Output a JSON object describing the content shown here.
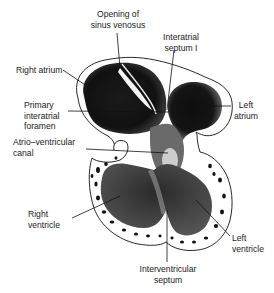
{
  "figure": {
    "colors": {
      "ink": "#111111",
      "background": "#ffffff",
      "stipple": "#555555"
    }
  },
  "labels": {
    "opening_sinus_venosus": {
      "line1": "Opening of",
      "line2": "sinus venosus"
    },
    "interatrial_septum": {
      "line1": "Interatrial",
      "line2": "septum I"
    },
    "right_atrium": {
      "line1": "Right atrium"
    },
    "primary_interatrial_foramen": {
      "line1": "Primary",
      "line2": "interatrial",
      "line3": "foramen"
    },
    "left_atrium": {
      "line1": "Left",
      "line2": "atrium"
    },
    "av_canal": {
      "line1": "Atrio–ventricular",
      "line2": "canal"
    },
    "right_ventricle": {
      "line1": "Right",
      "line2": "ventricle"
    },
    "left_ventricle": {
      "line1": "Left",
      "line2": "ventricle"
    },
    "interventricular_septum": {
      "line1": "Interventricular",
      "line2": "septum"
    }
  }
}
